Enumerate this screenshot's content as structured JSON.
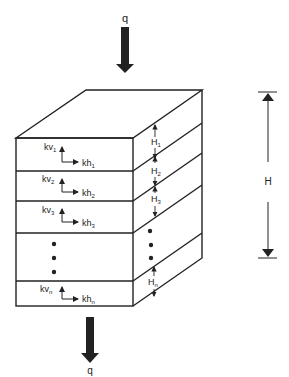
{
  "diagram": {
    "load_top_label": "q",
    "load_bottom_label": "q",
    "total_height_label": "H",
    "layers": [
      {
        "kv": "kv",
        "kv_sub": "1",
        "kh": "kh",
        "kh_sub": "1",
        "H": "H",
        "H_sub": "1"
      },
      {
        "kv": "kv",
        "kv_sub": "2",
        "kh": "kh",
        "kh_sub": "2",
        "H": "H",
        "H_sub": "2"
      },
      {
        "kv": "kv",
        "kv_sub": "3",
        "kh": "kh",
        "kh_sub": "3",
        "H": "H",
        "H_sub": "3"
      },
      {
        "kv": "",
        "kv_sub": "",
        "kh": "",
        "kh_sub": "",
        "H": "",
        "H_sub": "",
        "ellipsis": true
      },
      {
        "kv": "kv",
        "kv_sub": "n",
        "kh": "kh",
        "kh_sub": "n",
        "H": "H",
        "H_sub": "n"
      }
    ],
    "colors": {
      "line": "#222222",
      "background": "#ffffff"
    }
  }
}
